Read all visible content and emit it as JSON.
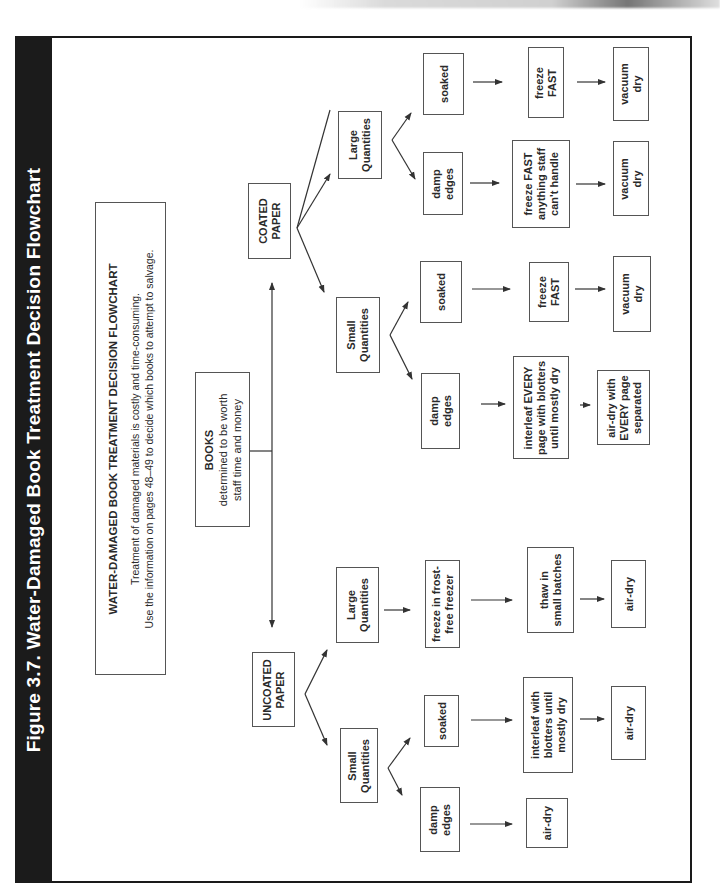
{
  "figure": {
    "title": "Figure 3.7.  Water-Damaged Book Treatment Decision Flowchart",
    "background_color": "#ffffff",
    "titlebar_color": "#1b1b1b",
    "orientation": "rotated 90° counter-clockwise"
  },
  "info_box": {
    "heading": "WATER-DAMAGED BOOK TREATMENT DECISION FLOWCHART",
    "line1": "Treatment of damaged materials is costly and time-consuming.",
    "line2": "Use the information on pages 48–49 to decide which books to attempt to salvage."
  },
  "root": {
    "line1": "BOOKS",
    "line2": "determined to be worth",
    "line3": "staff time and money"
  },
  "coated": {
    "label_line1": "COATED",
    "label_line2": "PAPER",
    "large": {
      "label_line1": "Large",
      "label_line2": "Quantities",
      "soaked": {
        "label": "soaked",
        "step1_line1": "freeze",
        "step1_line2": "FAST",
        "step2_line1": "vacuum",
        "step2_line2": "dry"
      },
      "damp": {
        "label_line1": "damp",
        "label_line2": "edges",
        "step1_line1": "freeze FAST",
        "step1_line2": "anything staff",
        "step1_line3": "can't handle",
        "step2_line1": "vacuum",
        "step2_line2": "dry"
      }
    },
    "small": {
      "label_line1": "Small",
      "label_line2": "Quantities",
      "soaked": {
        "label": "soaked",
        "step1_line1": "freeze",
        "step1_line2": "FAST",
        "step2_line1": "vacuum",
        "step2_line2": "dry"
      },
      "damp": {
        "label_line1": "damp",
        "label_line2": "edges",
        "step1_line1": "interleaf EVERY",
        "step1_line2": "page with blotters",
        "step1_line3": "until mostly dry",
        "step2_line1": "air-dry with",
        "step2_line2": "EVERY page",
        "step2_line3": "separated"
      }
    }
  },
  "uncoated": {
    "label_line1": "UNCOATED",
    "label_line2": "PAPER",
    "large": {
      "label_line1": "Large",
      "label_line2": "Quantities",
      "step1_line1": "freeze in frost-",
      "step1_line2": "free freezer",
      "step2_line1": "thaw in",
      "step2_line2": "small batches",
      "step3": "air-dry"
    },
    "small": {
      "label_line1": "Small",
      "label_line2": "Quantities",
      "soaked": {
        "label": "soaked",
        "step1_line1": "interleaf with",
        "step1_line2": "blotters until",
        "step1_line3": "mostly dry",
        "step2": "air-dry"
      },
      "damp": {
        "label_line1": "damp",
        "label_line2": "edges",
        "step1": "air-dry"
      }
    }
  }
}
